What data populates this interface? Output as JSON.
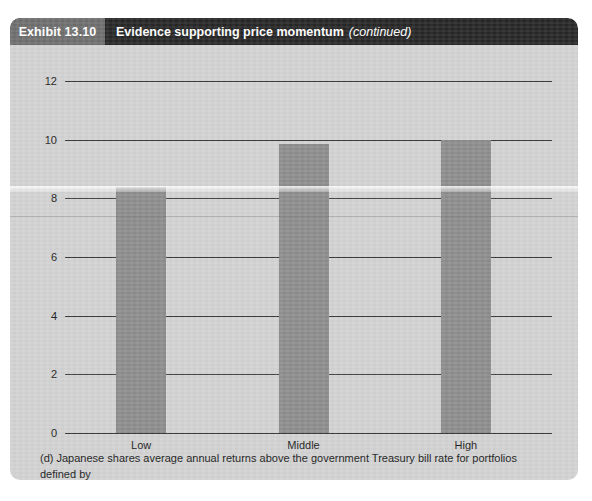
{
  "header": {
    "exhibit_label": "Exhibit 13.10",
    "title": "Evidence supporting price momentum",
    "continued": "(continued)"
  },
  "caption": {
    "line1": "(d) Japanese shares average annual returns above the government Treasury bill rate for portfolios defined by",
    "line2": "past share returns.  Percent per year, averaged for one-year holding periods, 1974–2011"
  },
  "colors": {
    "panel_background": "#d2d2d2",
    "header_background": "#262626",
    "exhibit_box": "#6e6e6e",
    "bar_fill": "#8d8d8d",
    "axis": "#3b3b3b",
    "text": "#1d1d1d"
  },
  "chart_data": {
    "type": "bar",
    "title": "Evidence supporting price momentum (continued)",
    "subtitle": "(d) Japanese shares average annual returns above the government Treasury bill rate for portfolios defined by past share returns.  Percent per year, averaged for one-year holding periods, 1974–2011",
    "categories": [
      "Low",
      "Middle",
      "High"
    ],
    "values": [
      8.4,
      9.85,
      10.0
    ],
    "xlabel": "",
    "ylabel": "",
    "ylim": [
      0,
      12
    ],
    "yticks": [
      0,
      2,
      4,
      6,
      8,
      10,
      12
    ],
    "ytick_labels": [
      "0",
      "2",
      "4",
      "6",
      "8",
      "10",
      "12"
    ],
    "grid": true,
    "legend": false,
    "bar_color": "#8d8d8d"
  }
}
